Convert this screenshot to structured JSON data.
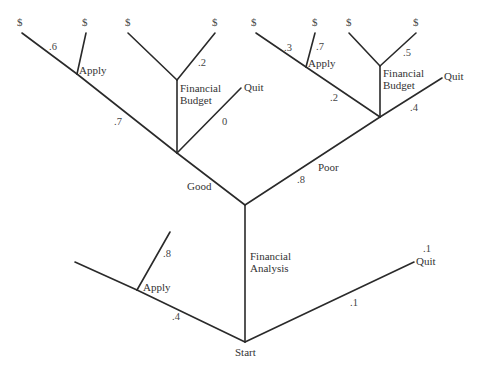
{
  "diagram": {
    "type": "decision-tree",
    "nodes": {
      "start": "Start",
      "financial_analysis": "Financial Analysis",
      "good": "Good",
      "poor": "Poor",
      "apply_bottom": "Apply",
      "quit_bottom": "Quit",
      "apply_top_left": "Apply",
      "budget_left": "Financial Budget",
      "quit_mid_left": "Quit",
      "apply_top_right": "Apply",
      "budget_right": "Financial Budget",
      "quit_right": "Quit"
    },
    "budget_line1": "Financial",
    "budget_line2": "Budget",
    "analysis_line1": "Financial",
    "analysis_line2": "Analysis",
    "payoff_symbol": "$",
    "probabilities": {
      "start_apply": ".4",
      "apply_bottom_branch": ".8",
      "start_quit": ".1",
      "quit_bottom_top": ".1",
      "good": ".7",
      "poor": ".8",
      "good_apply_left": ".6",
      "good_budget_right": ".2",
      "good_quit": "0",
      "poor_apply": ".2",
      "poor_apply_left": ".3",
      "poor_apply_right": ".7",
      "poor_budget_right": ".5",
      "poor_quit": ".4"
    }
  }
}
